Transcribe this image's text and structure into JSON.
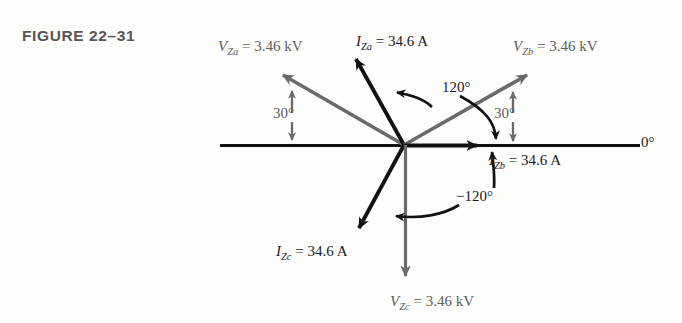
{
  "figure": {
    "caption": "FIGURE  22–31",
    "caption_color": "#565656"
  },
  "axis": {
    "zero_label": "0°",
    "color": "#111111"
  },
  "colors": {
    "current_phasor": "#111111",
    "voltage_phasor": "#6a6a6a",
    "angle_arc": "#111111",
    "angle_arc_gray": "#6a6a6a",
    "background": "#fdfdfb"
  },
  "phasors": [
    {
      "name": "V_Za",
      "symbol": "V",
      "subscript": "Za",
      "value": "3.46",
      "unit": "kV",
      "label": "V_Za = 3.46 kV",
      "kind": "voltage",
      "angle_deg": 150,
      "color": "#6a6a6a"
    },
    {
      "name": "I_Za",
      "symbol": "I",
      "subscript": "Za",
      "value": "34.6",
      "unit": "A",
      "label": "I_Za = 34.6 A",
      "kind": "current",
      "angle_deg": 120,
      "color": "#111111"
    },
    {
      "name": "V_Zb",
      "symbol": "V",
      "subscript": "Zb",
      "value": "3.46",
      "unit": "kV",
      "label": "V_Zb = 3.46 kV",
      "kind": "voltage",
      "angle_deg": 30,
      "color": "#6a6a6a"
    },
    {
      "name": "I_Zb",
      "symbol": "I",
      "subscript": "Zb",
      "value": "34.6",
      "unit": "A",
      "label": "I_Zb = 34.6 A",
      "kind": "current",
      "angle_deg": 0,
      "color": "#111111"
    },
    {
      "name": "I_Zc",
      "symbol": "I",
      "subscript": "Zc",
      "value": "34.6",
      "unit": "A",
      "label": "I_Zc = 34.6 A",
      "kind": "current",
      "angle_deg": -120,
      "color": "#111111"
    },
    {
      "name": "V_Zc",
      "symbol": "V",
      "subscript": "Zc",
      "value": "3.46",
      "unit": "kV",
      "label": "V_Zc = 3.46 kV",
      "kind": "voltage",
      "angle_deg": -90,
      "color": "#6a6a6a"
    }
  ],
  "angle_markers": [
    {
      "id": "ang-30-left",
      "text": "30°",
      "color": "#5e5e5e",
      "between": "V_Za to horizontal axis"
    },
    {
      "id": "ang-120-top",
      "text": "120°",
      "color": "#111111",
      "between": "I_Za to I_Zb"
    },
    {
      "id": "ang-30-right",
      "text": "30°",
      "color": "#5e5e5e",
      "between": "V_Zb to horizontal axis"
    },
    {
      "id": "ang-neg120",
      "text": "−120°",
      "color": "#111111",
      "between": "I_Zb to I_Zc"
    }
  ],
  "labels": {
    "vza": "V",
    "vza_sub": "Za",
    "vza_rest": " = 3.46 kV",
    "iza": "I",
    "iza_sub": "Za",
    "iza_rest": " = 34.6 A",
    "vzb": "V",
    "vzb_sub": "Zb",
    "vzb_rest": " = 3.46 kV",
    "izb": "I",
    "izb_sub": "Zb",
    "izb_rest": " = 34.6 A",
    "izc": "I",
    "izc_sub": "Zc",
    "izc_rest": " = 34.6 A",
    "vzc": "V",
    "vzc_sub": "Zc",
    "vzc_rest": " = 3.46 kV"
  },
  "geometry": {
    "origin_x": 404,
    "origin_y": 145,
    "axis_left_x": 220,
    "axis_right_x": 640
  }
}
